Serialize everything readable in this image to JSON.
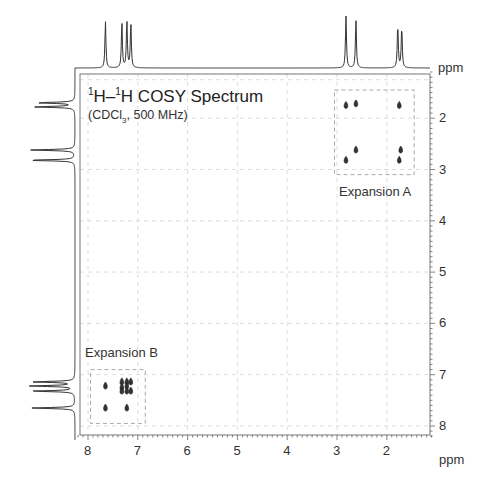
{
  "chart_data": {
    "type": "heatmap",
    "subtype": "2D NMR COSY contour plot with 1D projections",
    "title": "1H–1H COSY Spectrum",
    "title_parts": {
      "sup1": "1",
      "h1": "H–",
      "sup2": "1",
      "h2": "H COSY Spectrum"
    },
    "subtitle": "(CDCl3, 500 MHz)",
    "subtitle_parts": {
      "pre": "(CDCl",
      "sub": "3",
      "post": ", 500 MHz)"
    },
    "xlabel": "ppm",
    "ylabel": "ppm",
    "x_top_label": "ppm",
    "xlim": [
      8.2,
      1.1
    ],
    "ylim": [
      1.1,
      8.2
    ],
    "x_ticks": [
      8,
      7,
      6,
      5,
      4,
      3,
      2
    ],
    "y_ticks": [
      2,
      3,
      4,
      5,
      6,
      7,
      8
    ],
    "grid": "dashed, light gray, at integer ppm",
    "projection_peaks_ppm": [
      {
        "ppm": 7.65,
        "height": 0.9
      },
      {
        "ppm": 7.32,
        "height": 0.88
      },
      {
        "ppm": 7.22,
        "height": 0.92
      },
      {
        "ppm": 7.14,
        "height": 0.88
      },
      {
        "ppm": 2.82,
        "height": 1.0
      },
      {
        "ppm": 2.62,
        "height": 0.92
      },
      {
        "ppm": 1.78,
        "height": 0.84
      },
      {
        "ppm": 1.7,
        "height": 0.8
      }
    ],
    "crosspeaks": [
      {
        "x": 2.82,
        "y": 1.75
      },
      {
        "x": 2.62,
        "y": 1.72
      },
      {
        "x": 1.75,
        "y": 1.75
      },
      {
        "x": 2.62,
        "y": 2.62
      },
      {
        "x": 2.82,
        "y": 2.82
      },
      {
        "x": 1.72,
        "y": 2.62
      },
      {
        "x": 1.75,
        "y": 2.82
      },
      {
        "x": 7.65,
        "y": 7.22
      },
      {
        "x": 7.65,
        "y": 7.65
      },
      {
        "x": 7.32,
        "y": 7.14
      },
      {
        "x": 7.22,
        "y": 7.14
      },
      {
        "x": 7.14,
        "y": 7.14
      },
      {
        "x": 7.32,
        "y": 7.25
      },
      {
        "x": 7.22,
        "y": 7.22
      },
      {
        "x": 7.32,
        "y": 7.32
      },
      {
        "x": 7.22,
        "y": 7.32
      },
      {
        "x": 7.14,
        "y": 7.32
      },
      {
        "x": 7.22,
        "y": 7.65
      }
    ],
    "annotations": [
      {
        "text": "Expansion A",
        "region": {
          "x": [
            3.05,
            1.45
          ],
          "y": [
            1.45,
            3.1
          ]
        }
      },
      {
        "text": "Expansion B",
        "region": {
          "x": [
            7.95,
            6.85
          ],
          "y": [
            6.9,
            7.95
          ]
        }
      }
    ]
  }
}
